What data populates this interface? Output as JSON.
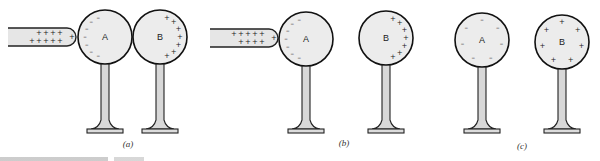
{
  "figure": {
    "panels": [
      {
        "label": "(a)",
        "label_pos": [
          128,
          147
        ],
        "rod": {
          "present": true,
          "x": 8,
          "y": 28,
          "w": 68,
          "h": 18,
          "charges": "+",
          "charge_rows": [
            [
              "+",
              "+",
              "+",
              "+"
            ],
            [
              "+",
              "+",
              "+",
              "+",
              "+"
            ]
          ]
        },
        "spheres": [
          {
            "name": "A",
            "cx": 105,
            "cy": 37,
            "r": 27,
            "charge": "-",
            "layout": "left-arc",
            "count": 7
          },
          {
            "name": "B",
            "cx": 160,
            "cy": 37,
            "r": 27,
            "charge": "+",
            "layout": "right-arc",
            "count": 7
          }
        ]
      },
      {
        "label": "(b)",
        "label_pos": [
          344,
          146
        ],
        "rod": {
          "present": true,
          "x": 210,
          "y": 29,
          "w": 68,
          "h": 18,
          "charges": "+",
          "charge_rows": [
            [
              "+",
              "+",
              "+",
              "+",
              "+"
            ],
            [
              "+",
              "+",
              "+",
              "+"
            ]
          ]
        },
        "spheres": [
          {
            "name": "A",
            "cx": 306,
            "cy": 39,
            "r": 27,
            "charge": "-",
            "layout": "left-arc",
            "count": 7
          },
          {
            "name": "B",
            "cx": 386,
            "cy": 38,
            "r": 27,
            "charge": "+",
            "layout": "right-arc",
            "count": 7
          }
        ]
      },
      {
        "label": "(c)",
        "label_pos": [
          522,
          149
        ],
        "rod": {
          "present": false
        },
        "spheres": [
          {
            "name": "A",
            "cx": 482,
            "cy": 40,
            "r": 27,
            "charge": "-",
            "layout": "uniform",
            "count": 7
          },
          {
            "name": "B",
            "cx": 562,
            "cy": 42,
            "r": 27,
            "charge": "+",
            "layout": "uniform",
            "count": 7
          }
        ]
      }
    ],
    "stand": {
      "stem_width": 8,
      "base_width": 36,
      "base_height": 4,
      "base_y": 130
    }
  }
}
